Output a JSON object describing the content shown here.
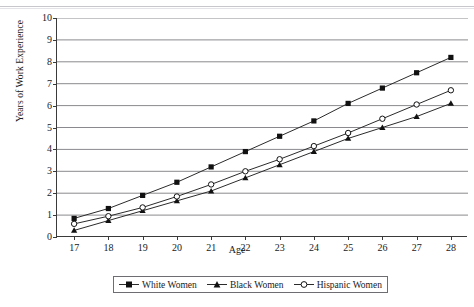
{
  "chart_data": {
    "type": "line",
    "title": "",
    "xlabel": "Age",
    "ylabel": "Years of Work Experience",
    "x": [
      17,
      18,
      19,
      20,
      21,
      22,
      23,
      24,
      25,
      26,
      27,
      28
    ],
    "xlim": [
      16.5,
      28.5
    ],
    "ylim": [
      0,
      10
    ],
    "ytick_labels": [
      "0",
      "1",
      "2",
      "3",
      "4",
      "5",
      "6",
      "7",
      "8",
      "9",
      "10"
    ],
    "xtick_labels": [
      "17",
      "18",
      "19",
      "20",
      "21",
      "22",
      "23",
      "24",
      "25",
      "26",
      "27",
      "28"
    ],
    "grid": "horizontal",
    "legend_position": "bottom",
    "series": [
      {
        "name": "White Women",
        "marker": "filled-square",
        "values": [
          0.85,
          1.3,
          1.9,
          2.5,
          3.2,
          3.9,
          4.6,
          5.3,
          6.1,
          6.8,
          7.5,
          8.2
        ]
      },
      {
        "name": "Black Women",
        "marker": "filled-triangle",
        "values": [
          0.3,
          0.75,
          1.2,
          1.65,
          2.1,
          2.7,
          3.3,
          3.9,
          4.5,
          5.0,
          5.5,
          6.1
        ]
      },
      {
        "name": "Hispanic Women",
        "marker": "open-circle",
        "values": [
          0.6,
          0.95,
          1.35,
          1.85,
          2.4,
          3.0,
          3.55,
          4.15,
          4.75,
          5.4,
          6.05,
          6.7
        ]
      }
    ]
  },
  "axes": {
    "y_title": "Years of Work Experience",
    "x_title": "Age"
  },
  "legend": {
    "items": [
      {
        "label": "White Women"
      },
      {
        "label": "Black Women"
      },
      {
        "label": "Hispanic Women"
      }
    ]
  },
  "colors": {
    "line": "#2b2b2b",
    "grid": "#8a8a8e",
    "axis": "#3a3a3a",
    "text": "#1a1a1a"
  }
}
